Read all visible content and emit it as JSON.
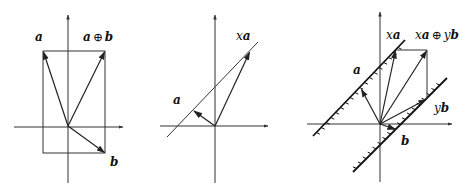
{
  "panels": [
    {
      "id": "sum",
      "labels": {
        "a": "a",
        "sum_a": "a",
        "sum_op": "⊕",
        "sum_b": "b",
        "b": "b"
      }
    },
    {
      "id": "scalar",
      "labels": {
        "a": "a",
        "xa_x": "x",
        "xa_a": "a"
      }
    },
    {
      "id": "combination",
      "labels": {
        "a": "a",
        "b": "b",
        "xa_x": "x",
        "xa_a": "a",
        "yb_y": "y",
        "yb_b": "b",
        "comb_x": "x",
        "comb_a": "a",
        "comb_op": "⊕",
        "comb_y": "y",
        "comb_b": "b"
      }
    }
  ],
  "colors": {
    "stroke": "#222222",
    "axis": "#333333",
    "background": "#ffffff"
  }
}
